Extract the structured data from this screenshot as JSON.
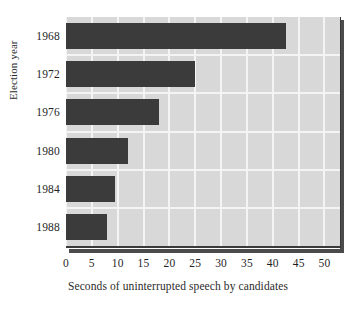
{
  "chart_data": {
    "type": "bar",
    "orientation": "horizontal",
    "title": "",
    "xlabel": "Seconds of uninterrupted speech by candidates",
    "ylabel": "Election year",
    "categories": [
      "1968",
      "1972",
      "1976",
      "1980",
      "1984",
      "1988"
    ],
    "values": [
      42.5,
      25,
      18,
      12,
      9.5,
      8
    ],
    "xlim": [
      0,
      53
    ],
    "xticks": [
      0,
      5,
      10,
      15,
      20,
      25,
      30,
      35,
      40,
      45,
      50
    ],
    "xtick_labels": [
      "0",
      "5",
      "10",
      "15",
      "20",
      "25",
      "30",
      "35",
      "40",
      "45",
      "50"
    ],
    "grid": true,
    "grid_axis": "both",
    "legend": false,
    "series": [
      {
        "name": "Seconds of uninterrupted speech",
        "values": [
          42.5,
          25,
          18,
          12,
          9.5,
          8
        ]
      }
    ],
    "colors": {
      "bar": "#3b3b3b",
      "plot_background": "#d8d8d8",
      "gridline": "#f4f4f4",
      "axis_line": "#3a3a3a",
      "shadow": "#4b4b4b",
      "text": "#1f1f1f",
      "page_background": "#ffffff"
    }
  }
}
